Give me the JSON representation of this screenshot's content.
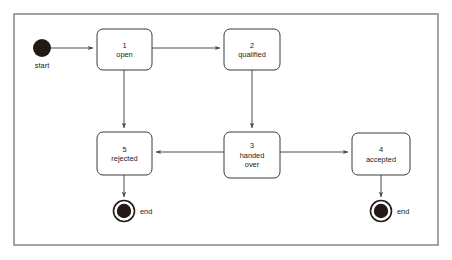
{
  "diagram": {
    "type": "uml-state-machine",
    "frame": {
      "x": 14,
      "y": 14,
      "width": 424,
      "height": 231
    },
    "colors": {
      "frame_border": "#8c8c8c",
      "box_border": "#3a3a3a",
      "box_fill": "#ffffff",
      "edge": "#4a4a4a",
      "node_fill": "#231a18",
      "text": "#1a1a1a",
      "background": "#ffffff"
    },
    "initial_node": {
      "label": "start",
      "cx": 42,
      "cy": 48,
      "r": 9,
      "label_x": 42,
      "label_y": 68
    },
    "final_nodes": [
      {
        "id": "end-1",
        "label": "end",
        "cx": 124,
        "cy": 211,
        "outer_r": 10.5,
        "inner_r": 7.2,
        "label_x": 140,
        "label_y": 214
      },
      {
        "id": "end-2",
        "label": "end",
        "cx": 381,
        "cy": 211,
        "outer_r": 10.5,
        "inner_r": 7.2,
        "label_x": 397,
        "label_y": 214
      }
    ],
    "states": [
      {
        "id": "state-1",
        "number": "1",
        "name": "open",
        "lines": [
          "1",
          "open"
        ],
        "x": 97,
        "y": 29,
        "width": 55,
        "height": 41
      },
      {
        "id": "state-2",
        "number": "2",
        "name": "qualified",
        "lines": [
          "2",
          "qualified"
        ],
        "x": 224,
        "y": 29,
        "width": 56,
        "height": 41
      },
      {
        "id": "state-5",
        "number": "5",
        "name": "rejected",
        "lines": [
          "5",
          "rejected"
        ],
        "x": 97,
        "y": 132,
        "width": 55,
        "height": 43
      },
      {
        "id": "state-3",
        "number": "3",
        "name": "handed over",
        "lines": [
          "3",
          "handed",
          "over"
        ],
        "x": 224,
        "y": 132,
        "width": 56,
        "height": 46
      },
      {
        "id": "state-4",
        "number": "4",
        "name": "accepted",
        "lines": [
          "4",
          "accepted"
        ],
        "x": 352,
        "y": 133,
        "width": 58,
        "height": 42
      }
    ],
    "transitions": [
      {
        "id": "t-start-open",
        "from": "start",
        "to": "state-1",
        "path": "M 51 48 L 93 48",
        "arrow": "right"
      },
      {
        "id": "t-open-qualified",
        "from": "state-1",
        "to": "state-2",
        "path": "M 152 48 L 220 48",
        "arrow": "right"
      },
      {
        "id": "t-open-rejected",
        "from": "state-1",
        "to": "state-5",
        "path": "M 124 70 L 124 128",
        "arrow": "down"
      },
      {
        "id": "t-qualified-handed",
        "from": "state-2",
        "to": "state-3",
        "path": "M 252 70 L 252 128",
        "arrow": "down"
      },
      {
        "id": "t-handed-rejected",
        "from": "state-3",
        "to": "state-5",
        "path": "M 224 152 L 156 152",
        "arrow": "left"
      },
      {
        "id": "t-handed-accepted",
        "from": "state-3",
        "to": "state-4",
        "path": "M 280 152 L 348 152",
        "arrow": "right"
      },
      {
        "id": "t-rejected-end",
        "from": "state-5",
        "to": "end-1",
        "path": "M 124 175 L 124 197",
        "arrow": "down"
      },
      {
        "id": "t-accepted-end",
        "from": "state-4",
        "to": "end-2",
        "path": "M 381 175 L 381 197",
        "arrow": "down"
      }
    ]
  }
}
